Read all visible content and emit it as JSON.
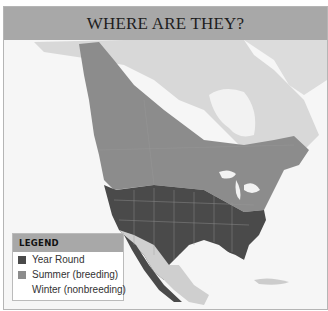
{
  "title": "WHERE ARE THEY?",
  "legend": {
    "heading": "LEGEND",
    "items": [
      {
        "label": "Year Round",
        "color": "#4a4a4a"
      },
      {
        "label": "Summer (breeding)",
        "color": "#8c8c8c"
      },
      {
        "label": "Winter (nonbreeding)",
        "color": null
      }
    ]
  },
  "map": {
    "region": "North America",
    "ranges": [
      "year-round",
      "summer-breeding"
    ],
    "colors": {
      "ocean": "#f4f4f4",
      "land": "#d6d6d6",
      "year_round": "#4a4a4a",
      "summer": "#8c8c8c",
      "title_bar": "#a8a8a8"
    }
  }
}
